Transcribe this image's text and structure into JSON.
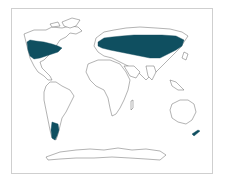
{
  "map": {
    "type": "world choropleth",
    "projection": "Robinson-like",
    "highlight_color": "#0f4f60",
    "land_fill": "#ffffff",
    "outline_color": "#555555",
    "frame_color": "#cfcfcf",
    "highlighted_regions": [
      "Northern United States and Southern Canada",
      "Europe",
      "Central Asia / Russia steppe",
      "Northern China and Mongolia",
      "Southern South America (Patagonia)",
      "New Zealand"
    ],
    "unhighlighted_regions": [
      "Greenland",
      "Arctic Canada",
      "Mexico & Central America",
      "Northern South America",
      "Africa",
      "Middle East",
      "South Asia",
      "Southeast Asia",
      "Australia",
      "Antarctica"
    ]
  }
}
